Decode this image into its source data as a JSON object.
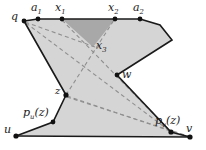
{
  "figure": {
    "colors": {
      "light_fill": "#d5d5d5",
      "dark_fill": "#a8a8a8",
      "outline": "#1a1a1a",
      "dashed": "#8c8c8c",
      "vertex": "#111111",
      "background": "#ffffff"
    },
    "vertices": [
      {
        "id": "q",
        "label": "q",
        "x": 24,
        "y": 21,
        "label_x": 12,
        "label_y": 12
      },
      {
        "id": "a1",
        "label": "a",
        "sub": "1",
        "x": 38,
        "y": 19,
        "label_x": 31,
        "label_y": 2
      },
      {
        "id": "x1",
        "label": "x",
        "sub": "1",
        "x": 62,
        "y": 19,
        "label_x": 55,
        "label_y": 2
      },
      {
        "id": "x2",
        "label": "x",
        "sub": "2",
        "x": 115,
        "y": 19,
        "label_x": 108,
        "label_y": 2
      },
      {
        "id": "a2",
        "label": "a",
        "sub": "2",
        "x": 140,
        "y": 19,
        "label_x": 133,
        "label_y": 2
      },
      {
        "id": "x3",
        "label": "x",
        "sub": "3",
        "x": 93,
        "y": 45,
        "label_x": 97,
        "label_y": 40
      },
      {
        "id": "w",
        "label": "w",
        "x": 117,
        "y": 75,
        "label_x": 122,
        "label_y": 69
      },
      {
        "id": "z",
        "label": "z",
        "x": 66,
        "y": 95,
        "label_x": 54,
        "label_y": 88
      },
      {
        "id": "pu",
        "label": "p",
        "sub": "u",
        "paren": "(z)",
        "x": 53,
        "y": 122,
        "label_x": 22,
        "label_y": 108
      },
      {
        "id": "u",
        "label": "u",
        "x": 16,
        "y": 136,
        "label_x": 5,
        "label_y": 125
      },
      {
        "id": "pv",
        "label": "p",
        "sub": "v",
        "paren": "(z)",
        "x": 171,
        "y": 132,
        "label_x": 156,
        "label_y": 117
      },
      {
        "id": "v",
        "label": "v",
        "x": 190,
        "y": 137,
        "label_x": 186,
        "label_y": 122
      }
    ],
    "regions": {
      "main_polygon": "M24,21 L38,19 L62,19 L115,19 L140,19 L160,25 L172,40 L117,75 L171,132 L190,137 L16,136 L53,122 L66,95 Z",
      "left_strip": "M24,21 L38,19 L66,95 L53,122 L16,136 Z",
      "dark_triangle": "M62,19 L115,19 L93,47 Z",
      "right_lobe": "M140,19 L160,25 L172,40 L117,75 Z"
    },
    "dashed_lines": [
      {
        "name": "q-to-pv",
        "from": [
          26,
          23
        ],
        "to": [
          171,
          132
        ]
      },
      {
        "name": "x3-to-u-diag",
        "from": [
          93,
          45
        ],
        "to": [
          24,
          22
        ]
      },
      {
        "name": "x1-to-pv",
        "from": [
          62,
          20
        ],
        "to": [
          171,
          132
        ]
      },
      {
        "name": "z-to-w-up",
        "from": [
          66,
          95
        ],
        "to": [
          115,
          20
        ]
      },
      {
        "name": "z-to-pv",
        "from": [
          66,
          95
        ],
        "to": [
          171,
          132
        ]
      },
      {
        "name": "z-to-v",
        "from": [
          66,
          95
        ],
        "to": [
          189,
          136
        ]
      },
      {
        "name": "w-to-pv",
        "from": [
          117,
          75
        ],
        "to": [
          171,
          132
        ]
      }
    ],
    "edges": [
      {
        "name": "top-edge",
        "from": "a1",
        "to": "a2"
      },
      {
        "name": "left-chain",
        "from": "q",
        "to": "z"
      },
      {
        "name": "lower-left-chain",
        "from": "z",
        "to": "u"
      },
      {
        "name": "bottom-edge",
        "from": "u",
        "to": "v"
      },
      {
        "name": "right-chain",
        "from": "a2",
        "to": "w"
      },
      {
        "name": "lower-right-chain",
        "from": "w",
        "to": "v"
      }
    ]
  }
}
